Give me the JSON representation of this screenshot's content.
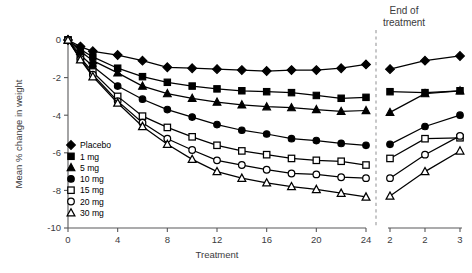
{
  "chart_data": {
    "type": "line",
    "title": "",
    "xlabel": "Treatment",
    "ylabel": "Mean % change in weight",
    "ylim": [
      -10,
      0.6
    ],
    "yticks": [
      0,
      -2,
      -4,
      -6,
      -8,
      -10
    ],
    "ytick_labels": [
      "0",
      "-2",
      "-4",
      "-6",
      "-8",
      "-10"
    ],
    "xticks_main": [
      0,
      4,
      8,
      12,
      16,
      20,
      24
    ],
    "xtick_labels_main": [
      "0",
      "4",
      "8",
      "12",
      "16",
      "20",
      "24"
    ],
    "xticks_post": [
      1,
      2,
      3
    ],
    "xtick_labels_post": [
      "2",
      "2",
      "3"
    ],
    "grid": false,
    "legend_position": "inside-left",
    "annotations": [
      {
        "text": "End of",
        "x": 24.6,
        "y": 0.5
      },
      {
        "text": "treatment",
        "x": 24.6,
        "y": 0.1
      }
    ],
    "break_marker": "dashed vertical line after week 24 marking end of treatment",
    "x_main": [
      0,
      1,
      2,
      4,
      6,
      8,
      10,
      12,
      14,
      16,
      18,
      20,
      22,
      24
    ],
    "x_post": [
      1,
      2,
      3
    ],
    "series": [
      {
        "name": "Placebo",
        "marker": "filled-diamond",
        "values": [
          0,
          -0.35,
          -0.6,
          -0.8,
          -1.1,
          -1.45,
          -1.5,
          -1.55,
          -1.6,
          -1.65,
          -1.6,
          -1.6,
          -1.5,
          -1.3
        ],
        "values_post": [
          -1.55,
          -1.1,
          -0.85
        ]
      },
      {
        "name": "1 mg",
        "marker": "filled-square",
        "values": [
          0,
          -0.5,
          -0.9,
          -1.5,
          -1.95,
          -2.25,
          -2.45,
          -2.6,
          -2.7,
          -2.75,
          -2.8,
          -2.95,
          -3.1,
          -3.05
        ],
        "values_post": [
          -2.75,
          -2.8,
          -2.7
        ]
      },
      {
        "name": "5 mg",
        "marker": "filled-triangle",
        "values": [
          0,
          -0.6,
          -1.1,
          -1.75,
          -2.45,
          -2.85,
          -3.1,
          -3.3,
          -3.45,
          -3.55,
          -3.6,
          -3.7,
          -3.8,
          -3.75
        ],
        "values_post": [
          -3.85,
          -2.85,
          -2.7
        ]
      },
      {
        "name": "10 mg",
        "marker": "filled-circle",
        "values": [
          0,
          -0.8,
          -1.4,
          -2.45,
          -3.15,
          -3.7,
          -4.1,
          -4.5,
          -4.8,
          -5.0,
          -5.25,
          -5.35,
          -5.5,
          -5.6
        ],
        "values_post": [
          -5.55,
          -4.6,
          -4.0
        ]
      },
      {
        "name": "15 mg",
        "marker": "open-square",
        "values": [
          0,
          -0.95,
          -1.7,
          -3.0,
          -4.05,
          -4.65,
          -5.15,
          -5.6,
          -5.9,
          -6.1,
          -6.3,
          -6.4,
          -6.45,
          -6.65
        ],
        "values_post": [
          -6.3,
          -5.25,
          -5.2
        ]
      },
      {
        "name": "20 mg",
        "marker": "open-circle",
        "values": [
          0,
          -1.0,
          -1.85,
          -3.25,
          -4.4,
          -5.25,
          -5.85,
          -6.4,
          -6.65,
          -6.9,
          -7.1,
          -7.15,
          -7.3,
          -7.35
        ],
        "values_post": [
          -7.35,
          -6.1,
          -5.1
        ]
      },
      {
        "name": "30 mg",
        "marker": "open-triangle",
        "values": [
          0,
          -1.05,
          -1.95,
          -3.35,
          -4.6,
          -5.55,
          -6.35,
          -7.0,
          -7.35,
          -7.6,
          -7.8,
          -7.95,
          -8.15,
          -8.35
        ],
        "values_post": [
          -8.3,
          -7.0,
          -5.9
        ]
      }
    ]
  },
  "legend": {
    "items": [
      {
        "label": "Placebo",
        "marker": "filled-diamond"
      },
      {
        "label": "1 mg",
        "marker": "filled-square"
      },
      {
        "label": "5 mg",
        "marker": "filled-triangle"
      },
      {
        "label": "10 mg",
        "marker": "filled-circle"
      },
      {
        "label": "15 mg",
        "marker": "open-square"
      },
      {
        "label": "20 mg",
        "marker": "open-circle"
      },
      {
        "label": "30 mg",
        "marker": "open-triangle"
      }
    ]
  },
  "colors": {
    "ink": "#000000",
    "axis": "#58585a",
    "text": "#3b3b3d",
    "dash": "#9a9a9c",
    "background": "#ffffff"
  }
}
